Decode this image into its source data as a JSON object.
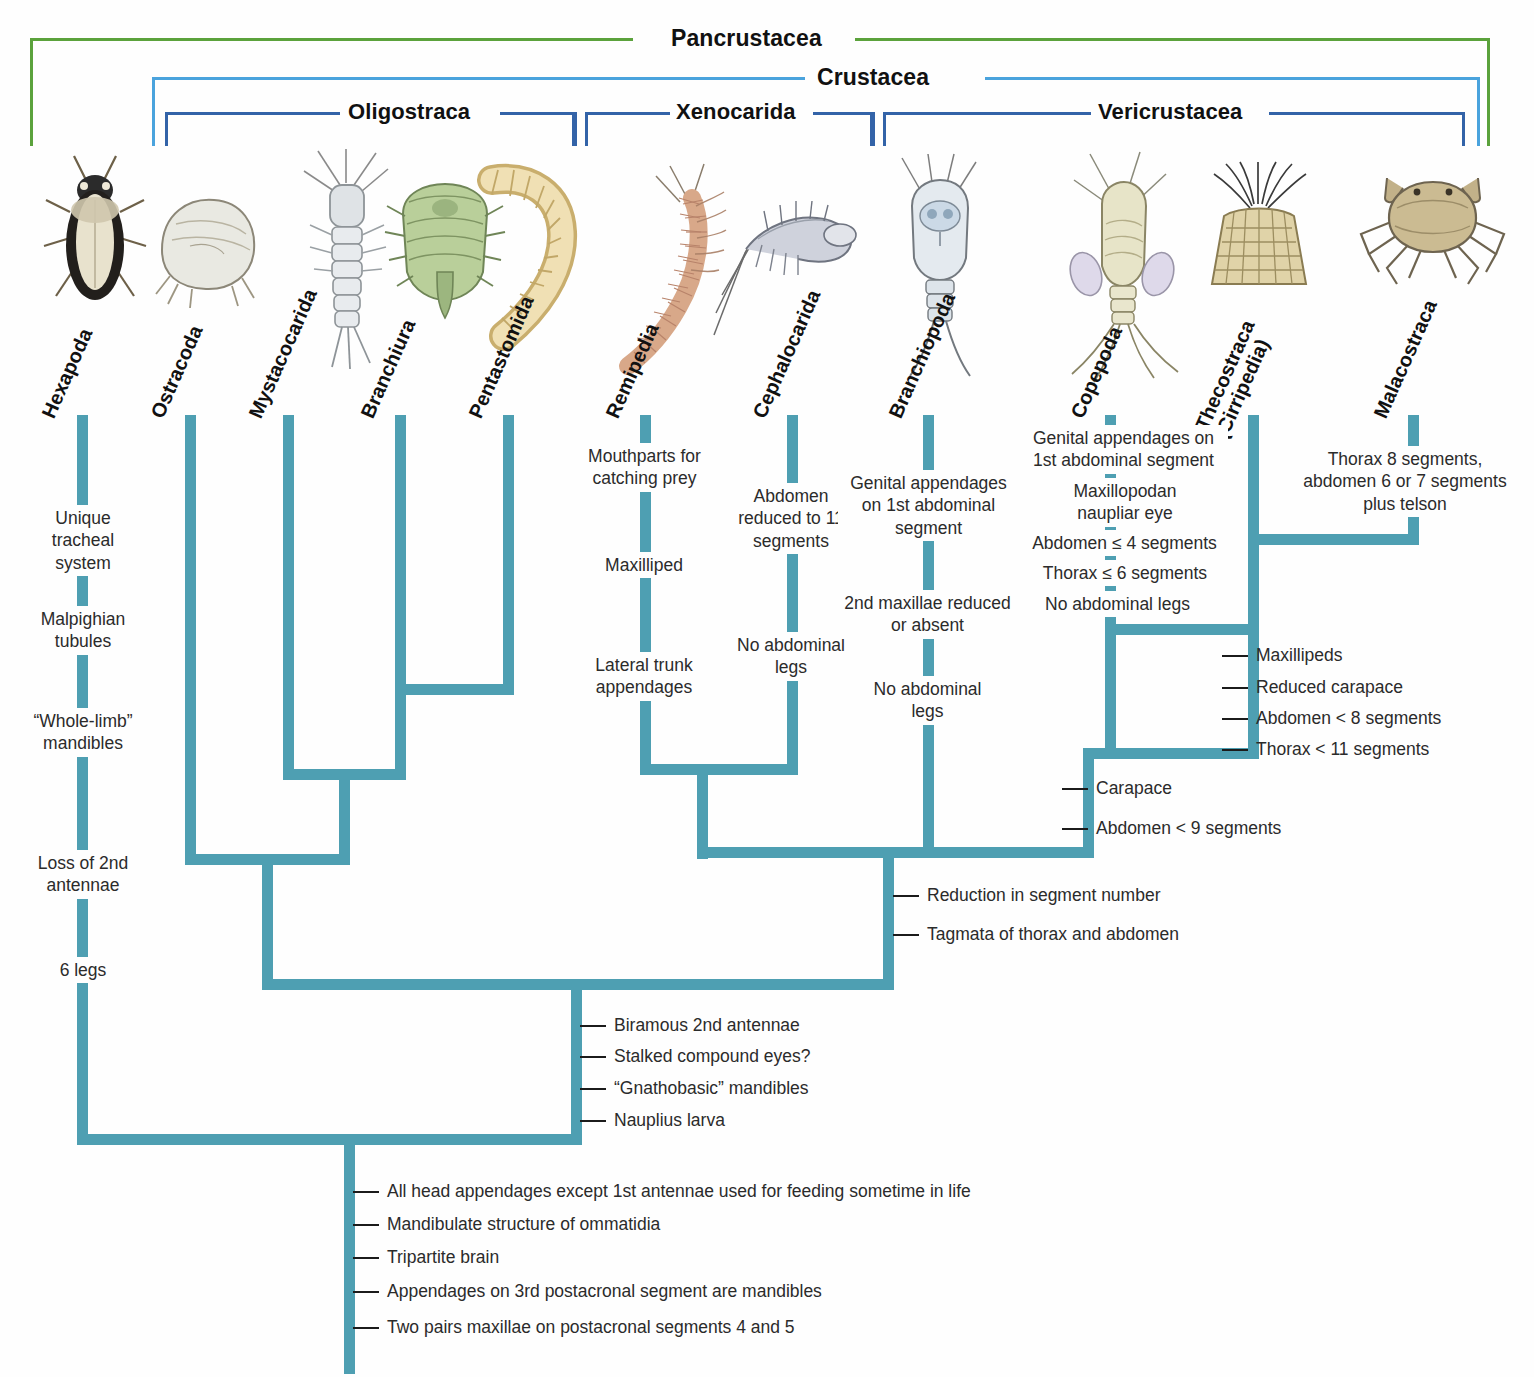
{
  "brackets": [
    {
      "name": "pancrustacea",
      "label": "Pancrustacea",
      "color": "#5ba23c"
    },
    {
      "name": "crustacea",
      "label": "Crustacea",
      "color": "#4aa3dd"
    },
    {
      "name": "oligostraca",
      "label": "Oligostraca",
      "color": "#3363a8"
    },
    {
      "name": "xenocarida",
      "label": "Xenocarida",
      "color": "#3363a8"
    },
    {
      "name": "vericrustacea",
      "label": "Vericrustacea",
      "color": "#3363a8"
    }
  ],
  "taxa": [
    {
      "name": "hexapoda",
      "label": "Hexapoda"
    },
    {
      "name": "ostracoda",
      "label": "Ostracoda"
    },
    {
      "name": "mystacocarida",
      "label": "Mystacocarida"
    },
    {
      "name": "branchiura",
      "label": "Branchiura"
    },
    {
      "name": "pentastomida",
      "label": "Pentastomida"
    },
    {
      "name": "remipedia",
      "label": "Remipedia"
    },
    {
      "name": "cephalocarida",
      "label": "Cephalocarida"
    },
    {
      "name": "branchiopoda",
      "label": "Branchiopoda"
    },
    {
      "name": "copepoda",
      "label": "Copepoda"
    },
    {
      "name": "thecostraca",
      "label": "Thecostraca",
      "label2": "(Cirripedia)"
    },
    {
      "name": "malacostraca",
      "label": "Malacostraca"
    }
  ],
  "characters": {
    "hexapoda": [
      "Unique\ntracheal\nsystem",
      "Malpighian\ntubules",
      "“Whole-limb”\nmandibles",
      "Loss of 2nd\nantennae",
      "6 legs"
    ],
    "remipedia": [
      "Mouthparts for\ncatching prey",
      "Maxilliped",
      "Lateral trunk\nappendages"
    ],
    "cephalocarida": [
      "Abdomen\nreduced to 11\nsegments",
      "No abdominal\nlegs"
    ],
    "branchiopoda": [
      "Genital appendages\non 1st abdominal\nsegment",
      "2nd maxillae reduced\nor absent",
      "No abdominal\nlegs"
    ],
    "copepoda": [
      "Genital appendages on\n1st abdominal segment",
      "Maxillopodan\nnaupliar eye",
      "Abdomen ≤ 4 segments",
      "Thorax ≤ 6 segments",
      "No abdominal legs"
    ],
    "malacostraca": [
      "Thorax 8 segments,\nabdomen 6 or 7 segments\nplus telson"
    ]
  },
  "node_ticks": {
    "thecostraca_malacostraca": [
      "Maxillipeds",
      "Reduced carapace",
      "Abdomen < 8 segments",
      "Thorax < 11 segments"
    ],
    "vericrustacea_node": [
      "Carapace",
      "Abdomen < 9 segments"
    ],
    "crustacea_upper": [
      "Reduction in segment number",
      "Tagmata of thorax and abdomen"
    ],
    "crustacea_node": [
      "Biramous 2nd antennae",
      "Stalked compound eyes?",
      "“Gnathobasic” mandibles",
      "Nauplius larva"
    ],
    "pancrustacea_root": [
      "All head appendages except 1st antennae used for feeding sometime in life",
      "Mandibulate structure of ommatidia",
      "Tripartite brain",
      "Appendages on 3rd postacronal segment are mandibles",
      "Two pairs maxillae on postacronal segments 4 and 5"
    ]
  },
  "colors": {
    "branch": "#4e9fb2",
    "pancrustacea": "#5ba23c",
    "crustacea": "#4aa3dd",
    "subclade": "#3363a8",
    "text": "#2b2b2b"
  }
}
